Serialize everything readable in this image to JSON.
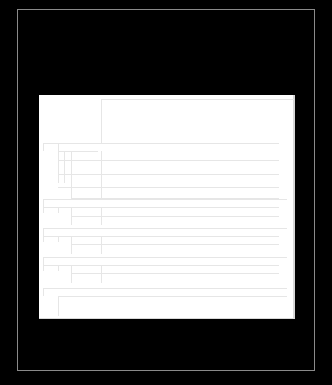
{
  "document": {
    "background_color": "#000000",
    "page_color": "#ffffff",
    "line_color": "#e6e6e6",
    "frame_color": "#8a8a8a",
    "header_box": {
      "x": 62,
      "y": 4,
      "w": 192,
      "h": 44
    },
    "hlines": [
      {
        "x": 4,
        "y": 48,
        "w": 236
      },
      {
        "x": 19,
        "y": 56,
        "w": 40
      },
      {
        "x": 19,
        "y": 65,
        "w": 221
      },
      {
        "x": 19,
        "y": 79,
        "w": 221
      },
      {
        "x": 19,
        "y": 92,
        "w": 221
      },
      {
        "x": 32,
        "y": 103,
        "w": 208
      },
      {
        "x": 4,
        "y": 104,
        "w": 244
      },
      {
        "x": 4,
        "y": 112,
        "w": 236
      },
      {
        "x": 32,
        "y": 121,
        "w": 208
      },
      {
        "x": 4,
        "y": 133,
        "w": 244
      },
      {
        "x": 4,
        "y": 141,
        "w": 236
      },
      {
        "x": 32,
        "y": 149,
        "w": 208
      },
      {
        "x": 4,
        "y": 162,
        "w": 244
      },
      {
        "x": 4,
        "y": 170,
        "w": 236
      },
      {
        "x": 32,
        "y": 178,
        "w": 208
      },
      {
        "x": 4,
        "y": 193,
        "w": 244
      },
      {
        "x": 19,
        "y": 201,
        "w": 229
      }
    ],
    "vlines": [
      {
        "x": 4,
        "y": 48,
        "h": 8
      },
      {
        "x": 19,
        "y": 48,
        "h": 40
      },
      {
        "x": 25,
        "y": 56,
        "h": 32
      },
      {
        "x": 32,
        "y": 56,
        "h": 48
      },
      {
        "x": 62,
        "y": 56,
        "h": 48
      },
      {
        "x": 4,
        "y": 104,
        "h": 14
      },
      {
        "x": 19,
        "y": 112,
        "h": 6
      },
      {
        "x": 32,
        "y": 112,
        "h": 18
      },
      {
        "x": 62,
        "y": 112,
        "h": 18
      },
      {
        "x": 4,
        "y": 133,
        "h": 14
      },
      {
        "x": 19,
        "y": 141,
        "h": 6
      },
      {
        "x": 32,
        "y": 141,
        "h": 18
      },
      {
        "x": 62,
        "y": 141,
        "h": 18
      },
      {
        "x": 4,
        "y": 162,
        "h": 14
      },
      {
        "x": 19,
        "y": 170,
        "h": 6
      },
      {
        "x": 32,
        "y": 170,
        "h": 18
      },
      {
        "x": 62,
        "y": 170,
        "h": 18
      },
      {
        "x": 4,
        "y": 193,
        "h": 8
      },
      {
        "x": 19,
        "y": 201,
        "h": 20
      }
    ]
  }
}
